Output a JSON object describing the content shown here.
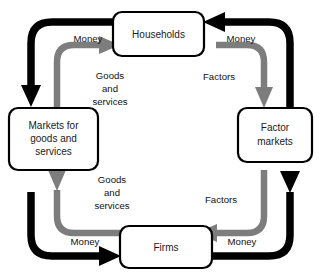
{
  "diagram": {
    "type": "circular-flow",
    "colors": {
      "money_flow": "#000000",
      "real_flow": "#7d7d7d",
      "box_border": "#000000",
      "box_fill": "#ffffff",
      "background": "#ffffff",
      "text": "#111111"
    },
    "nodes": [
      {
        "id": "households",
        "lines": [
          "Households"
        ],
        "position": "top-center"
      },
      {
        "id": "markets-goods-services",
        "lines": [
          "Markets for",
          "goods and",
          "services"
        ],
        "position": "middle-left"
      },
      {
        "id": "factor-markets",
        "lines": [
          "Factor",
          "markets"
        ],
        "position": "middle-right"
      },
      {
        "id": "firms",
        "lines": [
          "Firms"
        ],
        "position": "bottom-center"
      }
    ],
    "flows": [
      {
        "id": "money-households-to-markets",
        "label": "Money",
        "loop": "outer",
        "color": "#000000",
        "from": "households",
        "to": "markets-goods-services",
        "quadrant": "top-left"
      },
      {
        "id": "money-factor-markets-to-households",
        "label": "Money",
        "loop": "outer",
        "color": "#000000",
        "from": "factor-markets",
        "to": "households",
        "quadrant": "top-right"
      },
      {
        "id": "money-markets-to-firms",
        "label": "Money",
        "loop": "outer",
        "color": "#000000",
        "from": "markets-goods-services",
        "to": "firms",
        "quadrant": "bottom-left"
      },
      {
        "id": "money-firms-to-factor-markets",
        "label": "Money",
        "loop": "outer",
        "color": "#000000",
        "from": "firms",
        "to": "factor-markets",
        "quadrant": "bottom-right"
      },
      {
        "id": "goods-markets-to-households",
        "label_lines": [
          "Goods",
          "and",
          "services"
        ],
        "loop": "inner",
        "color": "#7d7d7d",
        "from": "markets-goods-services",
        "to": "households",
        "quadrant": "top-left"
      },
      {
        "id": "factors-households-to-factor-markets",
        "label_lines": [
          "Factors"
        ],
        "loop": "inner",
        "color": "#7d7d7d",
        "from": "households",
        "to": "factor-markets",
        "quadrant": "top-right"
      },
      {
        "id": "goods-firms-to-markets",
        "label_lines": [
          "Goods",
          "and",
          "services"
        ],
        "loop": "inner",
        "color": "#7d7d7d",
        "from": "firms",
        "to": "markets-goods-services",
        "quadrant": "bottom-left"
      },
      {
        "id": "factors-factor-markets-to-firms",
        "label_lines": [
          "Factors"
        ],
        "loop": "inner",
        "color": "#7d7d7d",
        "from": "factor-markets",
        "to": "firms",
        "quadrant": "bottom-right"
      }
    ],
    "labels": {
      "money_top_left": "Money",
      "money_top_right": "Money",
      "money_bottom_left": "Money",
      "money_bottom_right": "Money",
      "goods_top_1": "Goods",
      "goods_top_2": "and",
      "goods_top_3": "services",
      "goods_bottom_1": "Goods",
      "goods_bottom_2": "and",
      "goods_bottom_3": "services",
      "factors_top": "Factors",
      "factors_bottom": "Factors",
      "households": "Households",
      "markets_line1": "Markets for",
      "markets_line2": "goods and",
      "markets_line3": "services",
      "factor_markets_line1": "Factor",
      "factor_markets_line2": "markets",
      "firms": "Firms"
    }
  }
}
